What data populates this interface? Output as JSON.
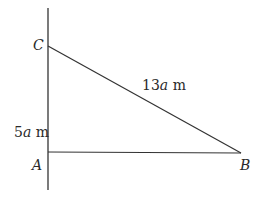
{
  "diagram": {
    "type": "right-triangle",
    "vertices": {
      "A": {
        "label": "A",
        "x": 48,
        "y": 152
      },
      "B": {
        "label": "B",
        "x": 241,
        "y": 153
      },
      "C": {
        "label": "C",
        "x": 48,
        "y": 46
      }
    },
    "sides": {
      "AC": {
        "coef": "5",
        "var": "a",
        "unit": " m"
      },
      "BC": {
        "coef": "13",
        "var": "a",
        "unit": " m"
      }
    },
    "line_color": "#333333"
  }
}
